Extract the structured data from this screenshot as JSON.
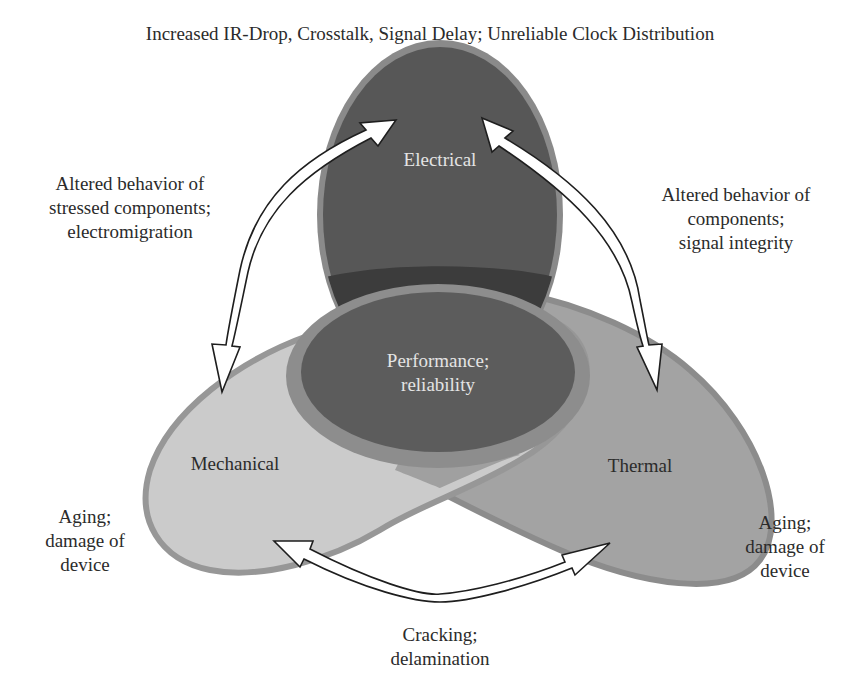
{
  "title": "Increased IR-Drop, Crosstalk, Signal Delay; Unreliable Clock Distribution",
  "domains": {
    "electrical": {
      "label": "Electrical",
      "fill": "#575757",
      "border": "#8a8a8a"
    },
    "mechanical": {
      "label": "Mechanical",
      "fill": "#cbcbcb",
      "border": "#979797"
    },
    "thermal": {
      "label": "Thermal",
      "fill": "#a3a3a3",
      "border": "#8c8c8c"
    },
    "center": {
      "lines": [
        "Performance;",
        "reliability"
      ],
      "fill": "#5c5c5c",
      "ring": "#8d8d8d"
    }
  },
  "interactions": {
    "electrical_mechanical": {
      "lines": [
        "Altered behavior of",
        "stressed components;",
        "electromigration"
      ]
    },
    "electrical_thermal": {
      "lines": [
        "Altered behavior of",
        "components;",
        "signal integrity"
      ]
    },
    "mechanical_thermal": {
      "lines": [
        "Cracking;",
        "delamination"
      ]
    }
  },
  "effects": {
    "mechanical": {
      "lines": [
        "Aging;",
        "damage of",
        "device"
      ]
    },
    "thermal": {
      "lines": [
        "Aging;",
        "damage of",
        "device"
      ]
    }
  },
  "colors": {
    "arrow_fill": "#ffffff",
    "arrow_stroke": "#1e1e1e",
    "band": "#3c3c3c"
  }
}
